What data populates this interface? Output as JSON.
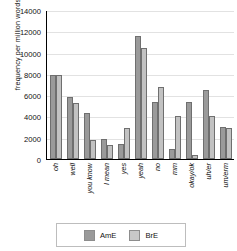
{
  "chart_data": {
    "type": "bar",
    "title": "",
    "xlabel": "",
    "ylabel": "frequency per million words",
    "ylim": [
      0,
      14000
    ],
    "yticks": [
      0,
      2000,
      4000,
      6000,
      8000,
      10000,
      12000,
      14000
    ],
    "grid": true,
    "legend_position": "bottom",
    "categories": [
      "oh",
      "well",
      "you know",
      "I mean",
      "yes",
      "yeah",
      "no",
      "mm",
      "okay/ok",
      "uh/er",
      "um/erm"
    ],
    "series": [
      {
        "name": "AmE",
        "color": "#9a9a9a",
        "values": [
          7900,
          5800,
          4300,
          1900,
          1400,
          11600,
          5400,
          900,
          5400,
          6500,
          3050
        ]
      },
      {
        "name": "BrE",
        "color": "#c2c2c2",
        "values": [
          7850,
          5300,
          1800,
          1300,
          2900,
          10400,
          6800,
          4000,
          400,
          4000,
          2950
        ]
      }
    ]
  },
  "legend": {
    "items": [
      {
        "label": "AmE",
        "color": "#9a9a9a"
      },
      {
        "label": "BrE",
        "color": "#c8c8c8"
      }
    ]
  }
}
